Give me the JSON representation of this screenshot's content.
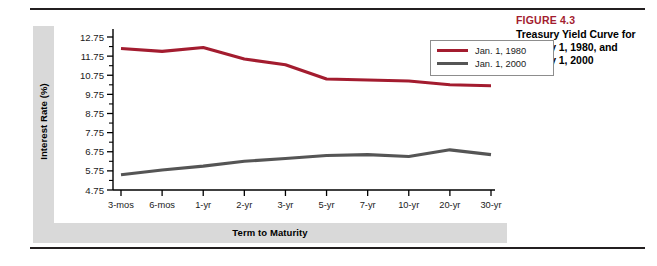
{
  "figure": {
    "number_label": "FIGURE 4.3",
    "caption": "Treasury Yield Curve for January 1, 1980, and January 1, 2000",
    "number_color": "#a31c2f"
  },
  "chart_data": {
    "type": "line",
    "title": "Treasury Yield Curve for January 1, 1980, and January 1, 2000",
    "xlabel": "Term to Maturity",
    "ylabel": "Interest Rate (%)",
    "categories": [
      "3-mos",
      "6-mos",
      "1-yr",
      "2-yr",
      "3-yr",
      "5-yr",
      "7-yr",
      "10-yr",
      "20-yr",
      "30-yr"
    ],
    "series": [
      {
        "name": "Jan. 1, 1980",
        "color": "#a31c2f",
        "values": [
          12.15,
          12.0,
          12.2,
          11.6,
          11.3,
          10.55,
          10.5,
          10.45,
          10.25,
          10.2
        ]
      },
      {
        "name": "Jan. 1, 2000",
        "color": "#555555",
        "values": [
          5.55,
          5.8,
          6.0,
          6.25,
          6.4,
          6.55,
          6.6,
          6.5,
          6.85,
          6.6
        ]
      }
    ],
    "ylim": [
      4.75,
      12.75
    ],
    "ytick_labels": [
      "4.75",
      "5.75",
      "6.75",
      "7.75",
      "8.75",
      "9.75",
      "10.75",
      "11.75",
      "12.75"
    ],
    "ytick_values": [
      4.75,
      5.75,
      6.75,
      7.75,
      8.75,
      9.75,
      10.75,
      11.75,
      12.75
    ],
    "minor_tick_step": 0.5,
    "grid": false,
    "legend_position": "top-right"
  }
}
